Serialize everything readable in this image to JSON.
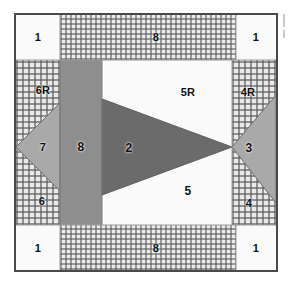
{
  "figure": {
    "shape": "square block with corner squares, sashing bands, side triangle units and a central arrow/flying-geese unit"
  },
  "palette": {
    "background": "#ffffff",
    "frame_line": "#4a4a4a",
    "seam_line": "#5a5a5a",
    "white_fabric": "#fafafa",
    "light_fabric": "#f4f4f2",
    "medium_gray_fabric": "#a9a9a9",
    "gray_fabric": "#8e8e8e",
    "dark_gray_fabric": "#6b6b6b",
    "checked_fabric_ground": "#e9e9e9",
    "checked_fabric_line": "#5a5a5a",
    "label_color": "#111111"
  },
  "pieces": [
    {
      "id": "corner-tl",
      "label": "1",
      "fabric": "white"
    },
    {
      "id": "corner-tr",
      "label": "1",
      "fabric": "white"
    },
    {
      "id": "corner-bl",
      "label": "1",
      "fabric": "white"
    },
    {
      "id": "corner-br",
      "label": "1",
      "fabric": "white"
    },
    {
      "id": "sashing-top",
      "label": "8",
      "fabric": "checked"
    },
    {
      "id": "sashing-bottom",
      "label": "8",
      "fabric": "checked"
    },
    {
      "id": "sashing-left-bar",
      "label": "8",
      "fabric": "gray"
    },
    {
      "id": "left-upper",
      "label": "6R",
      "fabric": "checked"
    },
    {
      "id": "left-lower",
      "label": "6",
      "fabric": "checked"
    },
    {
      "id": "left-triangle",
      "label": "7",
      "fabric": "medium-gray"
    },
    {
      "id": "right-upper",
      "label": "4R",
      "fabric": "checked"
    },
    {
      "id": "right-lower",
      "label": "4",
      "fabric": "checked"
    },
    {
      "id": "right-triangle",
      "label": "3",
      "fabric": "medium-gray"
    },
    {
      "id": "center-upper",
      "label": "5R",
      "fabric": "white"
    },
    {
      "id": "center-lower",
      "label": "5",
      "fabric": "white"
    },
    {
      "id": "center-arrow",
      "label": "2",
      "fabric": "dark-gray"
    }
  ],
  "labels": {
    "corner_tl": "1",
    "corner_tr": "1",
    "corner_bl": "1",
    "corner_br": "1",
    "sashing_top": "8",
    "sashing_bottom": "8",
    "sashing_bar": "8",
    "left_upper": "6R",
    "left_lower": "6",
    "left_triangle": "7",
    "right_upper": "4R",
    "right_lower": "4",
    "right_triangle": "3",
    "center_upper": "5R",
    "center_lower": "5",
    "center_arrow": "2"
  }
}
